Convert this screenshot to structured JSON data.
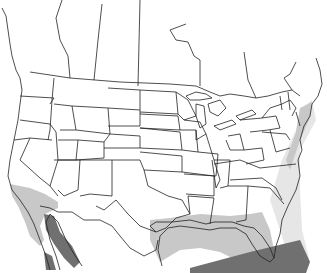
{
  "map": {
    "title": "",
    "region": "North America (USA, southern Canada, northern Mexico)",
    "legend": [],
    "colors": {
      "background": "#ffffff",
      "borders": "#222222",
      "range_light": "#c8c8c8",
      "range_stippled": "#e2e2e2",
      "range_dark": "#707070"
    },
    "ranges": [
      {
        "name": "light-range-pacific-coast",
        "shade": "light"
      },
      {
        "name": "dark-range-gulf-of-california",
        "shade": "dark"
      },
      {
        "name": "light-range-gulf-coast",
        "shade": "light"
      },
      {
        "name": "stippled-range-atlantic-offshore",
        "shade": "stippled"
      },
      {
        "name": "dark-range-gulf-of-mexico-south",
        "shade": "dark"
      },
      {
        "name": "light-range-northeast-coast",
        "shade": "light"
      }
    ]
  }
}
